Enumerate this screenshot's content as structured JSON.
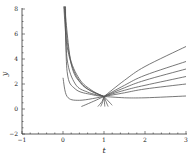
{
  "chart_data": {
    "type": "line",
    "title": "",
    "xlabel": "t",
    "ylabel": "y",
    "xlim": [
      -1,
      3
    ],
    "ylim": [
      -2,
      8
    ],
    "xticks": [
      -1,
      0,
      1,
      2,
      3
    ],
    "yticks": [
      -2,
      0,
      2,
      4,
      6,
      8
    ],
    "grid": false,
    "legend": null,
    "annotation": "Family of solution curves all passing through (1, 1)",
    "common_point": {
      "t": 1,
      "y": 1
    },
    "series": [
      {
        "name": "curve-left-1",
        "points": [
          [
            0.02,
            8.2
          ],
          [
            0.1,
            5.0
          ],
          [
            0.3,
            2.8
          ],
          [
            0.6,
            1.6
          ],
          [
            1,
            1
          ]
        ]
      },
      {
        "name": "curve-left-2",
        "points": [
          [
            0.03,
            8.2
          ],
          [
            0.15,
            4.4
          ],
          [
            0.4,
            2.4
          ],
          [
            0.7,
            1.5
          ],
          [
            1,
            1
          ]
        ]
      },
      {
        "name": "curve-left-3",
        "points": [
          [
            0.04,
            8.2
          ],
          [
            0.2,
            3.6
          ],
          [
            0.45,
            2.0
          ],
          [
            0.75,
            1.35
          ],
          [
            1,
            1
          ]
        ]
      },
      {
        "name": "curve-left-4",
        "points": [
          [
            0.05,
            8.2
          ],
          [
            0.1,
            4.0
          ],
          [
            0.3,
            2.0
          ],
          [
            0.6,
            1.35
          ],
          [
            1,
            1
          ]
        ]
      },
      {
        "name": "curve-left-5",
        "points": [
          [
            0.06,
            8.2
          ],
          [
            0.1,
            3.0
          ],
          [
            0.3,
            1.6
          ],
          [
            0.7,
            1.15
          ],
          [
            1,
            1
          ]
        ]
      },
      {
        "name": "curve-left-6",
        "points": [
          [
            0.0,
            2.5
          ],
          [
            0.1,
            1.0
          ],
          [
            0.4,
            0.7
          ],
          [
            1,
            1
          ]
        ]
      },
      {
        "name": "curve-right-1",
        "points": [
          [
            1,
            1
          ],
          [
            1.5,
            2.3
          ],
          [
            2,
            3.4
          ],
          [
            3,
            5.0
          ]
        ]
      },
      {
        "name": "curve-right-2",
        "points": [
          [
            1,
            1
          ],
          [
            1.5,
            1.9
          ],
          [
            2,
            2.7
          ],
          [
            3,
            3.8
          ]
        ]
      },
      {
        "name": "curve-right-3",
        "points": [
          [
            1,
            1
          ],
          [
            1.5,
            1.7
          ],
          [
            2,
            2.3
          ],
          [
            3,
            3.2
          ]
        ]
      },
      {
        "name": "curve-right-4",
        "points": [
          [
            1,
            1
          ],
          [
            1.5,
            1.5
          ],
          [
            2,
            1.9
          ],
          [
            3,
            2.6
          ]
        ]
      },
      {
        "name": "curve-right-5",
        "points": [
          [
            1,
            1
          ],
          [
            1.5,
            1.3
          ],
          [
            2,
            1.6
          ],
          [
            3,
            2.0
          ]
        ]
      },
      {
        "name": "curve-right-6",
        "points": [
          [
            1,
            1
          ],
          [
            1.5,
            0.9
          ],
          [
            2,
            0.9
          ],
          [
            3,
            1.04
          ]
        ]
      },
      {
        "name": "curve-lower-1",
        "points": [
          [
            0.45,
            0.2
          ],
          [
            0.7,
            0.55
          ],
          [
            1,
            1
          ]
        ]
      },
      {
        "name": "curve-lower-2",
        "points": [
          [
            0.85,
            0.2
          ],
          [
            0.95,
            0.6
          ],
          [
            1,
            1
          ]
        ]
      },
      {
        "name": "curve-lower-3",
        "points": [
          [
            0.92,
            0.2
          ],
          [
            0.97,
            0.6
          ],
          [
            1,
            1
          ]
        ]
      },
      {
        "name": "curve-lower-4",
        "points": [
          [
            1.02,
            0.2
          ],
          [
            1.01,
            0.6
          ],
          [
            1,
            1
          ]
        ]
      },
      {
        "name": "curve-lower-5",
        "points": [
          [
            1.1,
            0.2
          ],
          [
            1.05,
            0.6
          ],
          [
            1,
            1
          ]
        ]
      },
      {
        "name": "curve-lower-6",
        "points": [
          [
            1.2,
            0.3
          ],
          [
            1.1,
            0.65
          ],
          [
            1,
            1
          ]
        ]
      }
    ]
  },
  "axes": {
    "x_label": "t",
    "y_label": "y",
    "x_tick_labels": [
      "−1",
      "0",
      "1",
      "2",
      "3"
    ],
    "y_tick_labels": [
      "−2",
      "0",
      "2",
      "4",
      "6",
      "8"
    ]
  },
  "colors": {
    "curve": "#555555",
    "axis": "#333333",
    "background": "#ffffff"
  }
}
